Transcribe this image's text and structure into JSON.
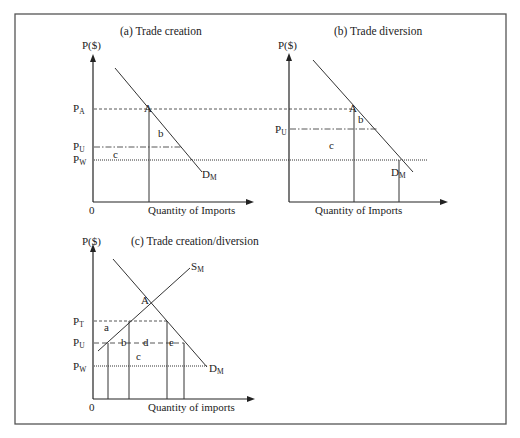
{
  "figure": {
    "frame_color": "#555555",
    "panels": [
      {
        "id": "a",
        "title": "(a) Trade creation",
        "y_axis_label": "P($)",
        "x_axis_label": "Quantity of Imports",
        "origin_label": "0",
        "price_labels": [
          {
            "main": "P",
            "sub": "A"
          },
          {
            "main": "P",
            "sub": "U"
          },
          {
            "main": "P",
            "sub": "W"
          }
        ],
        "curve_labels": [
          {
            "main": "D",
            "sub": "M"
          }
        ],
        "point_labels": [
          "A"
        ],
        "area_labels": [
          "b",
          "c"
        ]
      },
      {
        "id": "b",
        "title": "(b) Trade diversion",
        "y_axis_label": "P($)",
        "x_axis_label": "Quantity of Imports",
        "price_labels": [
          {
            "main": "P",
            "sub": "U"
          }
        ],
        "curve_labels": [
          {
            "main": "D",
            "sub": "M"
          }
        ],
        "point_labels": [
          "A"
        ],
        "area_labels": [
          "b",
          "c"
        ]
      },
      {
        "id": "c",
        "title": "(c) Trade creation/diversion",
        "y_axis_label": "P($)",
        "x_axis_label": "Quantity of imports",
        "origin_label": "0",
        "price_labels": [
          {
            "main": "P",
            "sub": "T"
          },
          {
            "main": "P",
            "sub": "U"
          },
          {
            "main": "P",
            "sub": "W"
          }
        ],
        "curve_labels": [
          {
            "main": "S",
            "sub": "M"
          },
          {
            "main": "D",
            "sub": "M"
          }
        ],
        "point_labels": [
          "A"
        ],
        "area_labels": [
          "a",
          "b",
          "c",
          "d",
          "e"
        ]
      }
    ]
  }
}
